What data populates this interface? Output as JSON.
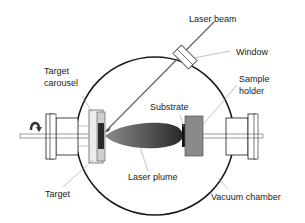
{
  "diagram": {
    "labels": {
      "laser_beam": "Laser beam",
      "window": "Window",
      "target_carousel_line1": "Target",
      "target_carousel_line2": "carousel",
      "sample_holder_line1": "Sample",
      "sample_holder_line2": "holder",
      "substrate": "Substrate",
      "laser_plume": "Laser plume",
      "target": "Target",
      "vacuum_chamber": "Vacuum chamber"
    },
    "icons": {
      "rotation": "rotation-arrow-icon"
    },
    "colors": {
      "outline": "#1a1a1a",
      "leader": "#888888",
      "sample_holder": "#8a8a8a",
      "target": "#2a2a2a",
      "carousel_fill": "#d0d0d0",
      "plume_dark": "#2a2a2a",
      "plume_light": "#7a7a7a",
      "beam": "#666666"
    }
  }
}
